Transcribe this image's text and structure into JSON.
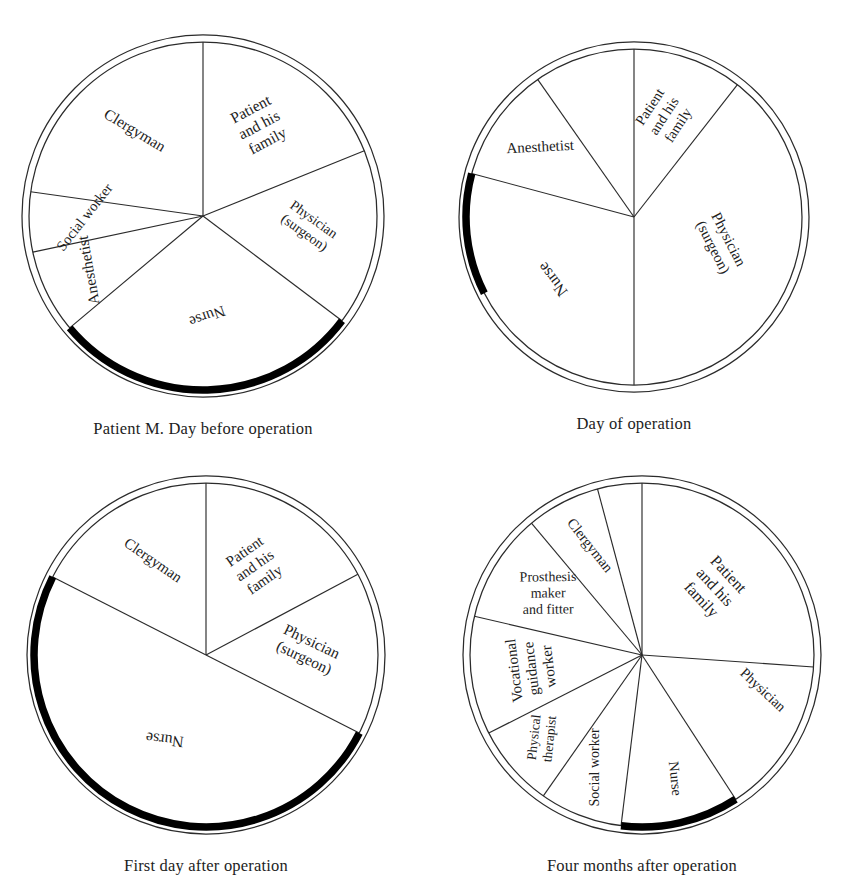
{
  "figure": {
    "title_visible": false,
    "background_color": "#ffffff",
    "line_color": "#2b2b2b",
    "highlight_color": "#000000",
    "text_color": "#1d1d1d"
  },
  "charts": [
    {
      "id": "chart-day-before",
      "caption": "Patient M. Day before operation",
      "cx": 203,
      "cy": 216,
      "r": 174,
      "r_outer": 181,
      "black_arc": {
        "start": 127,
        "end": 230
      },
      "slices": [
        {
          "name": "patient-and-family",
          "label": "Patient\nand his\nfamily",
          "start": 0,
          "end": 68,
          "label_r": 0.6,
          "rotate": -62,
          "font": 15.5
        },
        {
          "name": "physician-surgeon",
          "label": "Physician\n(surgeon)",
          "start": 68,
          "end": 127,
          "label_r": 0.6,
          "rotate": -62,
          "font": 14
        },
        {
          "name": "nurse",
          "label": "Nurse",
          "start": 127,
          "end": 230,
          "label_r": 0.55,
          "rotate": -18,
          "font": 15.5
        },
        {
          "name": "anesthetist",
          "label": "Anesthetist",
          "start": 230,
          "end": 258,
          "label_r": 0.7,
          "rotate": 16,
          "font": 15.5
        },
        {
          "name": "social-worker",
          "label": "Social worker",
          "start": 258,
          "end": 278,
          "label_r": 0.66,
          "rotate": 40,
          "font": 14.5
        },
        {
          "name": "clergyman",
          "label": "Clergyman",
          "start": 278,
          "end": 360,
          "label_r": 0.62,
          "rotate": 72,
          "font": 15.5
        }
      ]
    },
    {
      "id": "chart-day-of",
      "caption": "Day of operation",
      "cx": 634,
      "cy": 217,
      "r": 168,
      "r_outer": 175,
      "black_arc": {
        "start": 243,
        "end": 285
      },
      "slices": [
        {
          "name": "patient-and-family",
          "label": "Patient\nand his\nfamily",
          "start": 0,
          "end": 38,
          "label_r": 0.62,
          "rotate": -76,
          "font": 14.5
        },
        {
          "name": "physician-surgeon",
          "label": "Physician\n(surgeon)",
          "start": 38,
          "end": 180,
          "label_r": 0.52,
          "rotate": -46,
          "font": 15
        },
        {
          "name": "nurse",
          "label": "Nurse",
          "start": 180,
          "end": 285,
          "label_r": 0.58,
          "rotate": 0,
          "font": 16
        },
        {
          "name": "anesthetist",
          "label": "Anesthetist",
          "start": 285,
          "end": 325,
          "label_r": 0.68,
          "rotate": 52,
          "font": 15
        },
        {
          "name": "anesthetist-gap",
          "label": "",
          "start": 325,
          "end": 360,
          "label_r": 0.6,
          "rotate": 0,
          "font": 14
        }
      ]
    },
    {
      "id": "chart-first-day-after",
      "caption": "First day after operation",
      "cx": 206,
      "cy": 655,
      "r": 172,
      "r_outer": 179,
      "black_arc": {
        "start": 117,
        "end": 297
      },
      "slices": [
        {
          "name": "patient-and-family",
          "label": "Patient\nand his\nfamily",
          "start": 0,
          "end": 62,
          "label_r": 0.58,
          "rotate": -66,
          "font": 15
        },
        {
          "name": "physician-surgeon",
          "label": "Physician\n(surgeon)",
          "start": 62,
          "end": 117,
          "label_r": 0.58,
          "rotate": -64,
          "font": 15.5
        },
        {
          "name": "nurse",
          "label": "Nurse",
          "start": 117,
          "end": 297,
          "label_r": 0.52,
          "rotate": -20,
          "font": 16
        },
        {
          "name": "clergyman",
          "label": "Clergyman",
          "start": 297,
          "end": 360,
          "label_r": 0.62,
          "rotate": 66,
          "font": 15
        }
      ]
    },
    {
      "id": "chart-four-months-after",
      "caption": "Four months after operation",
      "cx": 642,
      "cy": 655,
      "r": 172,
      "r_outer": 179,
      "black_arc": {
        "start": 147,
        "end": 187
      },
      "slices": [
        {
          "name": "patient-and-family",
          "label": "Patient\nand his\nfamily",
          "start": 0,
          "end": 94,
          "label_r": 0.55,
          "rotate": 0,
          "font": 16
        },
        {
          "name": "physician",
          "label": "Physician",
          "start": 94,
          "end": 122,
          "label_r": 0.72,
          "rotate": -65,
          "font": 14.5
        },
        {
          "name": "nurse",
          "label": "Nurse",
          "start": 147,
          "end": 187,
          "label_r": 0.74,
          "rotate": -83,
          "font": 14.5
        },
        {
          "name": "social-worker",
          "label": "Social worker",
          "start": 187,
          "end": 215,
          "label_r": 0.7,
          "rotate": 69,
          "font": 14
        },
        {
          "name": "physical-therapist",
          "label": "Physical\ntherapist",
          "start": 215,
          "end": 243,
          "label_r": 0.74,
          "rotate": 47,
          "font": 13.5
        },
        {
          "name": "vocational-guidance-worker",
          "label": "Vocational\nguidance\nworker",
          "start": 243,
          "end": 283,
          "label_r": 0.62,
          "rotate": 0,
          "font": 15
        },
        {
          "name": "prosthesis-maker-and-fitter",
          "label": "Prosthesis\nmaker\nand fitter",
          "start": 283,
          "end": 320,
          "label_r": 0.64,
          "rotate": 58,
          "font": 14
        },
        {
          "name": "clergyman",
          "label": "Clergyman",
          "start": 320,
          "end": 345,
          "label_r": 0.7,
          "rotate": 79,
          "font": 14.5
        },
        {
          "name": "gap-upper",
          "label": "",
          "start": 345,
          "end": 360,
          "label_r": 0.6,
          "rotate": 0,
          "font": 13
        }
      ]
    }
  ],
  "chart_data": {
    "type": "pie",
    "title": "",
    "subtitle": "",
    "legend_position": "in-slice labels",
    "grid": false,
    "note": "Four pie charts showing the proportion of time/attention given by each member of the health team to a patient at four stages of care. Values are sector sweep angles in degrees out of 360; a thick black arc marks the nurse's sector on the circumference.",
    "charts": [
      {
        "title": "Patient M. Day before operation",
        "categories": [
          "Patient and his family",
          "Physician (surgeon)",
          "Nurse",
          "Anesthetist",
          "Social worker",
          "Clergyman"
        ],
        "values_degrees": [
          68,
          59,
          103,
          28,
          20,
          82
        ],
        "values_percent": [
          18.9,
          16.4,
          28.6,
          7.8,
          5.6,
          22.8
        ],
        "highlighted_slice": "Nurse"
      },
      {
        "title": "Day of operation",
        "categories": [
          "Patient and his family",
          "Physician (surgeon)",
          "Nurse",
          "Anesthetist"
        ],
        "values_degrees": [
          38,
          142,
          105,
          75
        ],
        "values_percent": [
          10.6,
          39.4,
          29.2,
          20.8
        ],
        "highlighted_slice": "Nurse"
      },
      {
        "title": "First day after operation",
        "categories": [
          "Patient and his family",
          "Physician (surgeon)",
          "Nurse",
          "Clergyman"
        ],
        "values_degrees": [
          62,
          55,
          180,
          63
        ],
        "values_percent": [
          17.2,
          15.3,
          50.0,
          17.5
        ],
        "highlighted_slice": "Nurse"
      },
      {
        "title": "Four months after operation",
        "categories": [
          "Patient and his family",
          "Physician",
          "Nurse",
          "Social worker",
          "Physical therapist",
          "Vocational guidance worker",
          "Prosthesis maker and fitter",
          "Clergyman"
        ],
        "values_degrees": [
          109,
          28,
          40,
          28,
          28,
          40,
          37,
          40
        ],
        "values_percent": [
          30.3,
          7.8,
          11.1,
          7.8,
          7.8,
          11.1,
          10.3,
          11.1
        ],
        "highlighted_slice": "Nurse"
      }
    ]
  }
}
